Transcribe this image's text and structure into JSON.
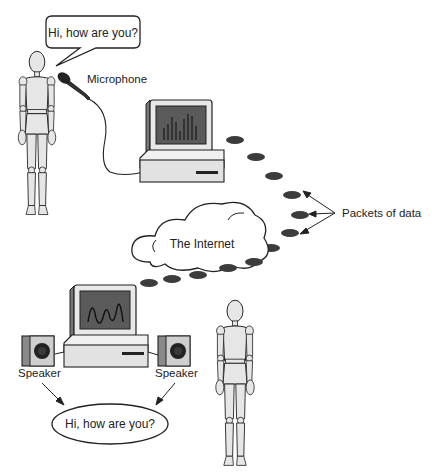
{
  "diagram": {
    "speaker_top": {
      "speech": "Hi, how are you?"
    },
    "microphone_label": "Microphone",
    "packets_label": "Packets of data",
    "internet_label": "The Internet",
    "speaker_left_label": "Speaker",
    "speaker_right_label": "Speaker",
    "speech_bottom": "Hi, how are you?",
    "colors": {
      "packet": "#3c3c3c",
      "screen": "#5a5a5a",
      "body": "#e4e4e4",
      "outline": "#222222"
    }
  }
}
